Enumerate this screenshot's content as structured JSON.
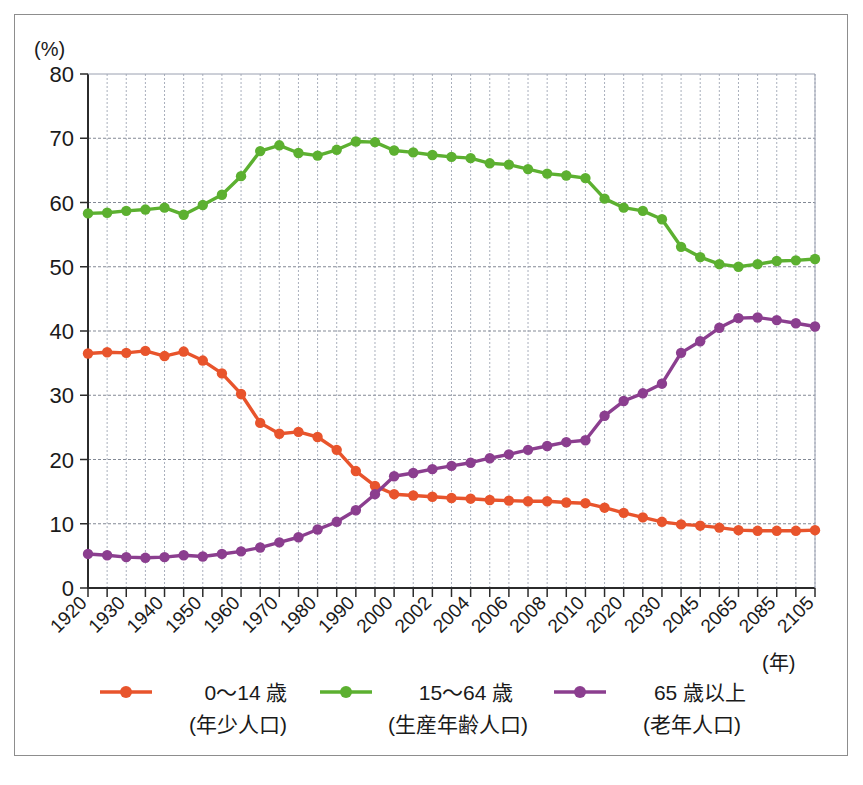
{
  "figure": {
    "background_color": "#ffffff",
    "frame_color": "#8d8d8d",
    "y_axis_unit": "(%)",
    "x_axis_unit": "(年)"
  },
  "chart_data": {
    "type": "line",
    "title": "",
    "subtitle": "",
    "xlabel": "(年)",
    "ylabel": "(%)",
    "ylim": [
      0,
      80
    ],
    "y_ticks": [
      0,
      10,
      20,
      30,
      40,
      50,
      60,
      70,
      80
    ],
    "grid": true,
    "legend_position": "bottom",
    "x_tick_labels": [
      "1920",
      "1930",
      "1940",
      "1950",
      "1960",
      "1970",
      "1980",
      "1990",
      "2000",
      "2002",
      "2004",
      "2006",
      "2008",
      "2010",
      "2020",
      "2030",
      "2045",
      "2065",
      "2085",
      "2105"
    ],
    "x": [
      "1920",
      "1925",
      "1930",
      "1935",
      "1940",
      "1945",
      "1950",
      "1955",
      "1960",
      "1965",
      "1970",
      "1975",
      "1980",
      "1985",
      "1990",
      "1995",
      "2000",
      "2001",
      "2002",
      "2003",
      "2004",
      "2005",
      "2006",
      "2007",
      "2008",
      "2009",
      "2010",
      "2015",
      "2020",
      "2025",
      "2030",
      "2038",
      "2045",
      "2055",
      "2065",
      "2075",
      "2085",
      "2095",
      "2105"
    ],
    "series": [
      {
        "name": "0〜14 歳",
        "sublabel": "(年少人口)",
        "color": "#e8542c",
        "values": [
          36.5,
          36.7,
          36.6,
          36.9,
          36.1,
          36.8,
          35.4,
          33.4,
          30.2,
          25.7,
          24.0,
          24.3,
          23.5,
          21.5,
          18.2,
          15.9,
          14.6,
          14.4,
          14.2,
          14.0,
          13.9,
          13.7,
          13.6,
          13.5,
          13.5,
          13.3,
          13.2,
          12.5,
          11.7,
          11.0,
          10.3,
          9.9,
          9.7,
          9.4,
          9.0,
          8.9,
          8.9,
          8.9,
          9.0
        ]
      },
      {
        "name": "15〜64 歳",
        "sublabel": "(生産年齢人口)",
        "color": "#5cb030",
        "values": [
          58.3,
          58.4,
          58.7,
          58.9,
          59.2,
          58.1,
          59.6,
          61.2,
          64.1,
          68.0,
          68.9,
          67.7,
          67.3,
          68.2,
          69.5,
          69.4,
          68.1,
          67.8,
          67.4,
          67.1,
          66.9,
          66.1,
          65.9,
          65.2,
          64.5,
          64.2,
          63.8,
          60.6,
          59.2,
          58.7,
          57.4,
          53.1,
          51.5,
          50.4,
          50.0,
          50.4,
          50.9,
          51.0,
          51.2
        ]
      },
      {
        "name": "65 歳以上",
        "sublabel": "(老年人口)",
        "color": "#8b3e8f",
        "values": [
          5.3,
          5.1,
          4.8,
          4.7,
          4.8,
          5.1,
          4.9,
          5.3,
          5.7,
          6.3,
          7.1,
          7.9,
          9.1,
          10.3,
          12.1,
          14.6,
          17.4,
          17.9,
          18.5,
          19.0,
          19.5,
          20.2,
          20.8,
          21.5,
          22.1,
          22.7,
          23.0,
          26.8,
          29.1,
          30.3,
          31.8,
          36.6,
          38.4,
          40.5,
          42.0,
          42.1,
          41.7,
          41.2,
          40.7
        ]
      }
    ]
  },
  "legend": {
    "items": [
      {
        "label": "0〜14 歳",
        "sublabel": "(年少人口)",
        "color": "#e8542c"
      },
      {
        "label": "15〜64 歳",
        "sublabel": "(生産年齢人口)",
        "color": "#5cb030"
      },
      {
        "label": "65 歳以上",
        "sublabel": "(老年人口)",
        "color": "#8b3e8f"
      }
    ]
  }
}
